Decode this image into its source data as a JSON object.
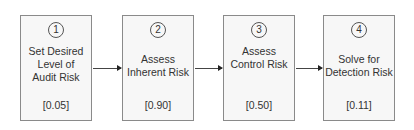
{
  "steps": [
    {
      "number": "1",
      "title": "Set Desired\nLevel of\nAudit Risk",
      "value": "[0.05]"
    },
    {
      "number": "2",
      "title": "Assess\nInherent Risk",
      "value": "[0.90]"
    },
    {
      "number": "3",
      "title": "Assess\nControl Risk",
      "value": "[0.50]"
    },
    {
      "number": "4",
      "title": "Solve for\nDetection Risk",
      "value": "[0.11]"
    }
  ],
  "colors": {
    "box_fill": "#f7f7f7",
    "box_border": "#8a8a8a",
    "arrow": "#444444",
    "text": "#333333"
  }
}
